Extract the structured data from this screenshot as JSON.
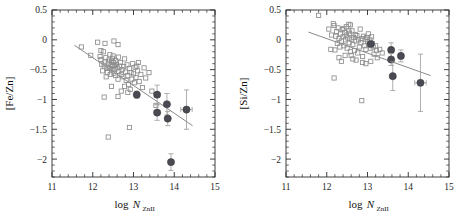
{
  "figure": {
    "background_color": "#ffffff",
    "panel_count": 2
  },
  "chart_data": [
    {
      "type": "scatter",
      "panel": "left",
      "title": "",
      "xlabel": "log N_ZnII",
      "xlabel_main": "log N",
      "xlabel_sub": "ZnII",
      "ylabel": "[Fe/Zn]",
      "xlim": [
        11,
        15
      ],
      "ylim": [
        -2.3,
        0.5
      ],
      "xticks": [
        11,
        12,
        13,
        14,
        15
      ],
      "xtick_labels": [
        "11",
        "12",
        "13",
        "14",
        "15"
      ],
      "yticks": [
        0.5,
        0,
        -0.5,
        -1,
        -1.5,
        -2
      ],
      "ytick_labels": [
        "0.5",
        "0",
        "−0.5",
        "−1",
        "−1.5",
        "−2"
      ],
      "grid": false,
      "legend": "none",
      "series": [
        {
          "name": "literature-sample",
          "marker": "open-square",
          "color": "#8d8d8d",
          "points": [
            [
              11.72,
              -0.12
            ],
            [
              11.95,
              -0.26
            ],
            [
              12.12,
              -0.04
            ],
            [
              12.18,
              -0.28
            ],
            [
              12.2,
              -0.33
            ],
            [
              12.22,
              -0.41
            ],
            [
              12.24,
              -0.52
            ],
            [
              12.26,
              -0.2
            ],
            [
              12.28,
              -0.44
            ],
            [
              12.3,
              -0.37
            ],
            [
              12.32,
              -0.3
            ],
            [
              12.33,
              -0.62
            ],
            [
              12.35,
              -0.46
            ],
            [
              12.36,
              -0.55
            ],
            [
              12.38,
              -0.39
            ],
            [
              12.4,
              -0.34
            ],
            [
              12.41,
              -0.48
            ],
            [
              12.42,
              -0.25
            ],
            [
              12.43,
              -0.58
            ],
            [
              12.45,
              -0.42
            ],
            [
              12.46,
              -0.36
            ],
            [
              12.47,
              -0.5
            ],
            [
              12.48,
              -0.31
            ],
            [
              12.49,
              -0.45
            ],
            [
              12.5,
              -0.27
            ],
            [
              12.51,
              -0.38
            ],
            [
              12.52,
              -0.56
            ],
            [
              12.53,
              -0.43
            ],
            [
              12.54,
              -0.49
            ],
            [
              12.55,
              -0.35
            ],
            [
              12.56,
              -0.6
            ],
            [
              12.58,
              -0.41
            ],
            [
              12.6,
              -0.47
            ],
            [
              12.62,
              -0.66
            ],
            [
              12.63,
              -0.29
            ],
            [
              12.64,
              -0.53
            ],
            [
              12.66,
              -0.44
            ],
            [
              12.68,
              -0.38
            ],
            [
              12.7,
              -0.58
            ],
            [
              12.72,
              -0.5
            ],
            [
              12.74,
              -0.62
            ],
            [
              12.76,
              -0.45
            ],
            [
              12.78,
              -0.78
            ],
            [
              12.8,
              -0.54
            ],
            [
              12.82,
              -0.68
            ],
            [
              12.84,
              -0.42
            ],
            [
              12.86,
              -0.6
            ],
            [
              12.88,
              -0.75
            ],
            [
              12.9,
              -0.48
            ],
            [
              12.92,
              -0.83
            ],
            [
              12.94,
              -0.55
            ],
            [
              12.96,
              -0.66
            ],
            [
              12.98,
              -0.4
            ],
            [
              13.0,
              -0.57
            ],
            [
              13.02,
              -0.72
            ],
            [
              13.04,
              -0.46
            ],
            [
              13.06,
              -0.63
            ],
            [
              13.1,
              -0.52
            ],
            [
              13.14,
              -0.7
            ],
            [
              13.18,
              -0.58
            ],
            [
              13.22,
              -0.8
            ],
            [
              13.26,
              -0.47
            ],
            [
              13.3,
              -0.64
            ],
            [
              13.38,
              -0.55
            ],
            [
              13.45,
              -0.86
            ],
            [
              13.55,
              -1.1
            ],
            [
              12.28,
              -0.96
            ],
            [
              12.62,
              -0.95
            ],
            [
              12.86,
              -0.88
            ],
            [
              12.9,
              -1.47
            ],
            [
              12.38,
              -1.63
            ],
            [
              12.2,
              -0.18
            ],
            [
              12.52,
              -0.02
            ],
            [
              12.62,
              -0.08
            ],
            [
              12.3,
              -0.06
            ],
            [
              12.78,
              -0.32
            ],
            [
              13.08,
              -0.44
            ],
            [
              13.12,
              -0.38
            ],
            [
              12.46,
              -0.78
            ],
            [
              12.7,
              -0.86
            ]
          ]
        },
        {
          "name": "this-work",
          "marker": "filled-circle",
          "color": "#4a4a52",
          "points": [
            {
              "x": 13.08,
              "y": -0.92,
              "xerr": 0.05,
              "yerr": 0.06
            },
            {
              "x": 13.58,
              "y": -0.92,
              "xerr": 0.06,
              "yerr": 0.16
            },
            {
              "x": 13.58,
              "y": -1.22,
              "xerr": 0.07,
              "yerr": 0.13
            },
            {
              "x": 13.82,
              "y": -1.08,
              "xerr": 0.06,
              "yerr": 0.18
            },
            {
              "x": 13.84,
              "y": -1.32,
              "xerr": 0.06,
              "yerr": 0.12
            },
            {
              "x": 14.3,
              "y": -1.17,
              "xerr": 0.14,
              "yerr": 0.33
            },
            {
              "x": 13.92,
              "y": -2.05,
              "xerr": 0.05,
              "yerr": 0.14
            }
          ]
        }
      ],
      "fit_line": {
        "x0": 11.55,
        "y0": -0.09,
        "x1": 14.45,
        "y1": -1.44
      }
    },
    {
      "type": "scatter",
      "panel": "right",
      "title": "",
      "xlabel": "log N_ZnII",
      "xlabel_main": "log N",
      "xlabel_sub": "ZnII",
      "ylabel": "[Si/Zn]",
      "xlim": [
        11,
        15
      ],
      "ylim": [
        -2.3,
        0.5
      ],
      "xticks": [
        11,
        12,
        13,
        14,
        15
      ],
      "xtick_labels": [
        "11",
        "12",
        "13",
        "14",
        "15"
      ],
      "yticks": [
        0.5,
        0,
        -0.5,
        -1,
        -1.5,
        -2
      ],
      "ytick_labels": [
        "0.5",
        "0",
        "−0.5",
        "−1",
        "−1.5",
        "−2"
      ],
      "grid": false,
      "legend": "none",
      "series": [
        {
          "name": "literature-sample",
          "marker": "open-square",
          "color": "#8d8d8d",
          "points": [
            [
              11.8,
              0.41
            ],
            [
              12.05,
              0.18
            ],
            [
              12.12,
              0.08
            ],
            [
              12.18,
              0.24
            ],
            [
              12.2,
              -0.17
            ],
            [
              12.22,
              0.06
            ],
            [
              12.24,
              0.14
            ],
            [
              12.26,
              -0.06
            ],
            [
              12.28,
              0.2
            ],
            [
              12.3,
              0.02
            ],
            [
              12.32,
              -0.12
            ],
            [
              12.34,
              0.1
            ],
            [
              12.36,
              -0.02
            ],
            [
              12.38,
              0.17
            ],
            [
              12.4,
              0.05
            ],
            [
              12.42,
              -0.1
            ],
            [
              12.44,
              0.12
            ],
            [
              12.45,
              -0.26
            ],
            [
              12.46,
              0.0
            ],
            [
              12.48,
              0.08
            ],
            [
              12.5,
              -0.14
            ],
            [
              12.52,
              0.03
            ],
            [
              12.54,
              0.26
            ],
            [
              12.55,
              -0.05
            ],
            [
              12.56,
              0.11
            ],
            [
              12.58,
              -0.2
            ],
            [
              12.6,
              0.01
            ],
            [
              12.62,
              0.15
            ],
            [
              12.64,
              -0.08
            ],
            [
              12.66,
              0.04
            ],
            [
              12.68,
              -0.18
            ],
            [
              12.7,
              0.09
            ],
            [
              12.72,
              -0.02
            ],
            [
              12.74,
              0.07
            ],
            [
              12.76,
              -0.22
            ],
            [
              12.78,
              0.0
            ],
            [
              12.8,
              -0.12
            ],
            [
              12.82,
              0.18
            ],
            [
              12.84,
              -0.05
            ],
            [
              12.86,
              0.02
            ],
            [
              12.88,
              -0.28
            ],
            [
              12.9,
              0.06
            ],
            [
              12.92,
              -0.1
            ],
            [
              12.94,
              0.01
            ],
            [
              12.96,
              -0.16
            ],
            [
              12.98,
              0.04
            ],
            [
              13.0,
              -0.03
            ],
            [
              13.02,
              0.1
            ],
            [
              13.04,
              -0.08
            ],
            [
              13.06,
              0.0
            ],
            [
              13.08,
              -0.14
            ],
            [
              13.1,
              0.05
            ],
            [
              13.12,
              -0.06
            ],
            [
              13.16,
              -0.24
            ],
            [
              13.2,
              -0.1
            ],
            [
              13.24,
              -0.3
            ],
            [
              13.3,
              -0.16
            ],
            [
              13.36,
              -0.22
            ],
            [
              12.16,
              0.27
            ],
            [
              12.48,
              0.22
            ],
            [
              12.58,
              0.25
            ],
            [
              12.72,
              -0.34
            ],
            [
              12.88,
              -0.38
            ],
            [
              12.96,
              -0.4
            ],
            [
              13.08,
              -0.36
            ],
            [
              12.1,
              -0.16
            ],
            [
              12.3,
              -0.3
            ],
            [
              12.36,
              -0.36
            ],
            [
              12.18,
              -0.64
            ],
            [
              12.86,
              -1.02
            ],
            [
              12.6,
              -0.26
            ],
            [
              12.64,
              -0.32
            ],
            [
              12.42,
              0.19
            ],
            [
              12.54,
              0.15
            ],
            [
              13.14,
              -0.12
            ],
            [
              13.22,
              -0.18
            ]
          ]
        },
        {
          "name": "this-work",
          "marker": "filled-circle",
          "color": "#4a4a52",
          "points": [
            {
              "x": 13.08,
              "y": -0.07,
              "xerr": 0.05,
              "yerr": 0.05
            },
            {
              "x": 13.58,
              "y": -0.17,
              "xerr": 0.05,
              "yerr": 0.12
            },
            {
              "x": 13.58,
              "y": -0.33,
              "xerr": 0.05,
              "yerr": 0.1
            },
            {
              "x": 13.82,
              "y": -0.27,
              "xerr": 0.05,
              "yerr": 0.1
            },
            {
              "x": 13.62,
              "y": -0.61,
              "xerr": 0.05,
              "yerr": 0.24
            },
            {
              "x": 14.3,
              "y": -0.72,
              "xerr": 0.14,
              "yerr": 0.48
            }
          ]
        }
      ],
      "fit_line": {
        "x0": 11.55,
        "y0": 0.13,
        "x1": 14.55,
        "y1": -0.6
      }
    }
  ]
}
